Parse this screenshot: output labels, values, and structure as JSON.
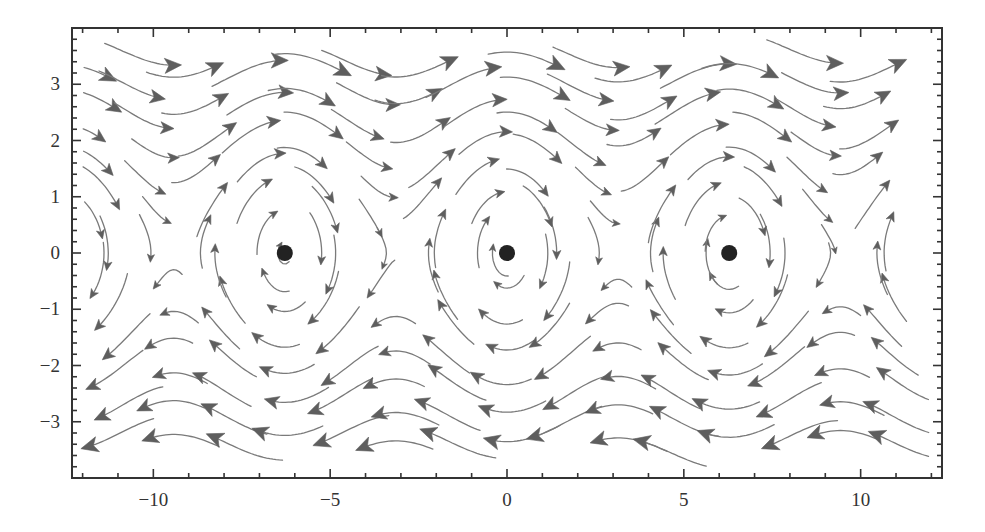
{
  "chart_data": {
    "type": "stream",
    "title": "",
    "xlabel": "",
    "ylabel": "",
    "system": {
      "dx_dt": "y",
      "dy_dt": "-sin(x)",
      "description": "pendulum phase portrait"
    },
    "xlim": [
      -12.3,
      12.3
    ],
    "ylim": [
      -4,
      4
    ],
    "x_ticks": [
      {
        "value": -10,
        "label": "−10"
      },
      {
        "value": -5,
        "label": "−5"
      },
      {
        "value": 0,
        "label": "0"
      },
      {
        "value": 5,
        "label": "5"
      },
      {
        "value": 10,
        "label": "10"
      }
    ],
    "y_ticks": [
      {
        "value": -3,
        "label": "−3"
      },
      {
        "value": -2,
        "label": "−2"
      },
      {
        "value": -1,
        "label": "−1"
      },
      {
        "value": 0,
        "label": "0"
      },
      {
        "value": 1,
        "label": "1"
      },
      {
        "value": 2,
        "label": "2"
      },
      {
        "value": 3,
        "label": "3"
      }
    ],
    "x_minor_step": 1,
    "y_minor_step": 0.2,
    "fixed_points": [
      {
        "x": -6.283,
        "y": 0,
        "kind": "center"
      },
      {
        "x": 0,
        "y": 0,
        "kind": "center"
      },
      {
        "x": 6.283,
        "y": 0,
        "kind": "center"
      }
    ],
    "grid": false,
    "legend": null,
    "colors": {
      "stream": "#7a7a7a",
      "arrow": "#5e5e5e",
      "fixed_point": "#222222",
      "frame": "#333333"
    }
  },
  "layout": {
    "plot_left": 72,
    "plot_top": 28,
    "plot_right": 942,
    "plot_bottom": 478
  }
}
